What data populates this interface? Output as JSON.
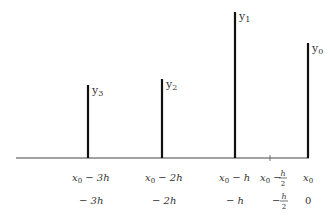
{
  "diagram": {
    "type": "stem-plot",
    "axis": {
      "x_start": 16,
      "x_end": 308,
      "baseline_y": 158
    },
    "stems": [
      {
        "id": "y3",
        "label": "y",
        "sub": "3",
        "x": 88,
        "top": 85
      },
      {
        "id": "y2",
        "label": "y",
        "sub": "2",
        "x": 162,
        "top": 79
      },
      {
        "id": "y1",
        "label": "y",
        "sub": "1",
        "x": 235,
        "top": 12
      },
      {
        "id": "y0",
        "label": "y",
        "sub": "0",
        "x": 308,
        "top": 43
      }
    ],
    "tick": {
      "x": 270
    },
    "row1_labels": [
      {
        "text": "x",
        "sub": "0",
        "rest": " − 3h",
        "x": 72
      },
      {
        "text": "x",
        "sub": "0",
        "rest": " − 2h",
        "x": 145
      },
      {
        "text": "x",
        "sub": "0",
        "rest": " − h",
        "x": 219
      },
      {
        "text": "x",
        "sub": "0",
        "rest": " − ",
        "x": 260,
        "frac": {
          "num": "h",
          "den": "2"
        }
      },
      {
        "text": "x",
        "sub": "0",
        "rest": "",
        "x": 303
      }
    ],
    "row2_labels": [
      {
        "text": "− 3h",
        "x": 79
      },
      {
        "text": "− 2h",
        "x": 152
      },
      {
        "text": "− h",
        "x": 226
      },
      {
        "text": "− ",
        "x": 272,
        "frac": {
          "num": "h",
          "den": "2"
        }
      },
      {
        "text": "0",
        "x": 305
      }
    ]
  }
}
